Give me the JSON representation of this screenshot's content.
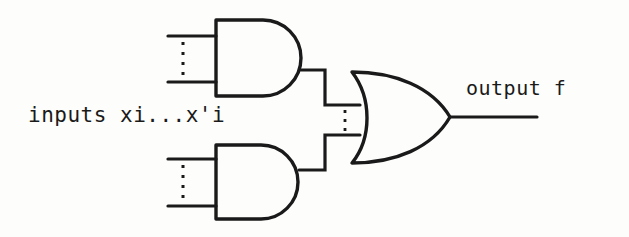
{
  "figure": {
    "kind": "logic-circuit-diagram",
    "background_color": "#fdfdfb",
    "ink_color": "#1a1a1a"
  },
  "labels": {
    "inputs": "inputs xi...x'i",
    "output": "output f"
  },
  "gates": [
    {
      "name": "and-gate-top",
      "type": "AND",
      "inputs": 2,
      "input_ellipsis": true
    },
    {
      "name": "and-gate-bottom",
      "type": "AND",
      "inputs": 2,
      "input_ellipsis": true
    },
    {
      "name": "or-gate",
      "type": "OR",
      "inputs": 2,
      "input_ellipsis": true
    }
  ],
  "wires": {
    "input_stubs": 4,
    "interconnects": 2,
    "output_lines": 1,
    "vertical_ellipses": 3
  }
}
